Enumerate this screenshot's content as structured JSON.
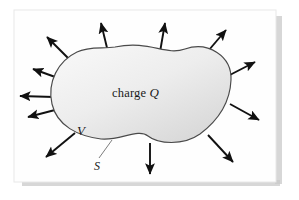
{
  "figure": {
    "page": {
      "background_color": "#ffffff",
      "sheet_color": "#fefefe",
      "shadow_color": "#c9c9c9",
      "border_color": "#e4e4e4"
    },
    "blob": {
      "name": "closed-surface-blob",
      "fill_light": "#f2f2f2",
      "fill_dark": "#d9d9d9",
      "stroke_color": "#4a4a4a",
      "stroke_width": 1.1
    },
    "labels": {
      "charge_prefix": "charge ",
      "charge_symbol": "Q",
      "volume_symbol": "V",
      "surface_symbol": "S"
    },
    "leader_line": {
      "name": "surface-leader-line",
      "color": "#6e6e6e"
    },
    "arrows": {
      "color": "#111111",
      "count": 12,
      "description": "Electric field flux vectors pointing outward normal to the closed surface",
      "vectors": [
        {
          "id": "arrow-top-left-diagonal",
          "x1": 72,
          "y1": 62,
          "x2": 45,
          "y2": 35
        },
        {
          "id": "arrow-top-left-up",
          "x1": 108,
          "y1": 52,
          "x2": 100,
          "y2": 20
        },
        {
          "id": "arrow-top-center-up",
          "x1": 160,
          "y1": 52,
          "x2": 166,
          "y2": 20
        },
        {
          "id": "arrow-top-right-diagonal",
          "x1": 203,
          "y1": 57,
          "x2": 228,
          "y2": 27
        },
        {
          "id": "arrow-upper-right",
          "x1": 224,
          "y1": 78,
          "x2": 258,
          "y2": 60
        },
        {
          "id": "arrow-right-lower",
          "x1": 230,
          "y1": 104,
          "x2": 262,
          "y2": 122
        },
        {
          "id": "arrow-lower-right",
          "x1": 208,
          "y1": 135,
          "x2": 235,
          "y2": 165
        },
        {
          "id": "arrow-bottom-center-down",
          "x1": 150,
          "y1": 143,
          "x2": 150,
          "y2": 177
        },
        {
          "id": "arrow-bottom-left",
          "x1": 75,
          "y1": 133,
          "x2": 43,
          "y2": 160
        },
        {
          "id": "arrow-left-horizontal",
          "x1": 54,
          "y1": 97,
          "x2": 17,
          "y2": 96
        },
        {
          "id": "arrow-left-upper",
          "x1": 55,
          "y1": 110,
          "x2": 25,
          "y2": 118
        },
        {
          "id": "arrow-left-low-diagonal",
          "x1": 58,
          "y1": 78,
          "x2": 30,
          "y2": 68
        }
      ]
    }
  }
}
